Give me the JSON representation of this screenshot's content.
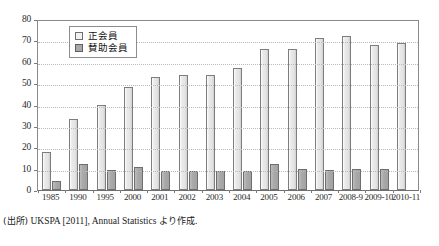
{
  "chart_data": {
    "type": "bar",
    "title": "",
    "subtitle": "",
    "xlabel": "",
    "ylabel": "",
    "ylim": [
      0,
      80
    ],
    "yticks": [
      0,
      10,
      20,
      30,
      40,
      50,
      60,
      70,
      80
    ],
    "grid": true,
    "legend_position": "upper-left-inside",
    "categories": [
      "1985",
      "1990",
      "1995",
      "2000",
      "2001",
      "2002",
      "2003",
      "2004",
      "2005",
      "2006",
      "2007",
      "2008-9",
      "2009-10",
      "2010-11"
    ],
    "series": [
      {
        "name": "正会員",
        "values": [
          18,
          33,
          40,
          48,
          53,
          54,
          54,
          57,
          66,
          66,
          71,
          72,
          68,
          69
        ]
      },
      {
        "name": "賛助会員",
        "values": [
          4,
          12,
          9.5,
          11,
          9,
          9,
          9,
          9,
          12,
          10,
          9.5,
          10,
          10,
          0
        ]
      }
    ],
    "colors": {
      "primary_fill": "#e9e9e9",
      "primary_edge": "#7d7d7d",
      "secondary_fill": "#a8a8a8",
      "secondary_edge": "#6e6e6e",
      "gridline": "#b9b9b9",
      "axis": "#8a8a8a",
      "text": "#2b2b2b"
    }
  },
  "legend": {
    "items": [
      {
        "label": "正会員"
      },
      {
        "label": "賛助会員"
      }
    ]
  },
  "source_note": {
    "prefix": "(出所)",
    "body": "UKSPA [2011], Annual Statistics",
    "suffix": "より作成."
  }
}
